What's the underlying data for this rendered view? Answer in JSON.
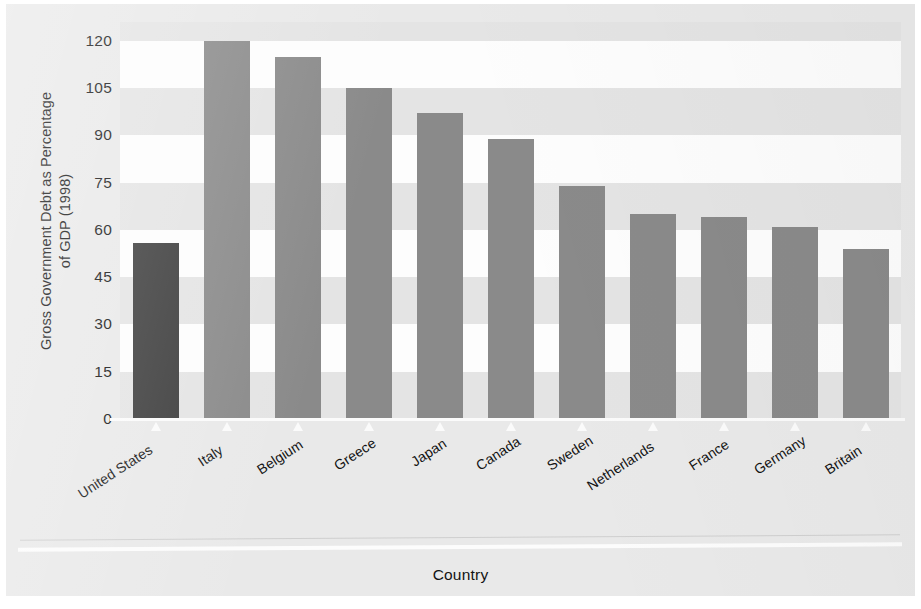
{
  "chart_data": {
    "type": "bar",
    "title": "",
    "xlabel": "Country",
    "ylabel": "Gross Government Debt as Percentage of GDP (1998)",
    "ylabel_line1": "Gross Government Debt as Percentage",
    "ylabel_line2": "of GDP (1998)",
    "categories": [
      "United States",
      "Italy",
      "Belgium",
      "Greece",
      "Japan",
      "Canada",
      "Sweden",
      "Netherlands",
      "France",
      "Germany",
      "Britain"
    ],
    "values": [
      56,
      120,
      115,
      105,
      97,
      89,
      74,
      65,
      64,
      61,
      54
    ],
    "ylim": [
      0,
      126
    ],
    "yticks": [
      0,
      15,
      30,
      45,
      60,
      75,
      90,
      105,
      120
    ],
    "ytick_labels": [
      "0",
      "15",
      "30",
      "45",
      "60",
      "75",
      "90",
      "105",
      "120"
    ],
    "grid": "horizontal-banded",
    "legend": "none",
    "highlight_index": 0,
    "colors": {
      "bar": "#8a8a8a",
      "bar_highlight": "#3c3c3c",
      "band_light": "#fdfdfd",
      "band_dark": "#e4e4e4",
      "panel": "#e9e9e9",
      "text": "#131313"
    }
  }
}
